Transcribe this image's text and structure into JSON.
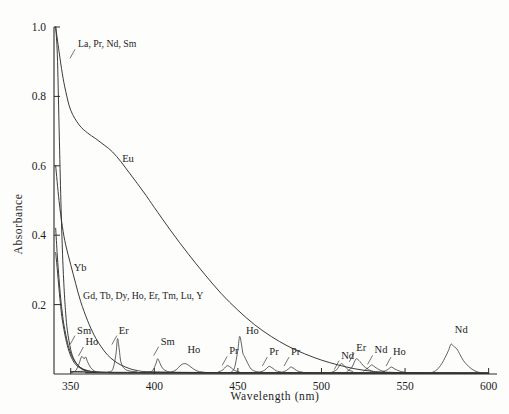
{
  "figure": {
    "title": "",
    "background_color": "#fdfdfc",
    "line_color": "#30302e"
  },
  "chart_data": {
    "type": "line",
    "title": "",
    "subtitle": "",
    "xlabel": "Wavelength  (nm)",
    "ylabel": "Absorbance",
    "xlim": [
      340,
      605
    ],
    "ylim": [
      0,
      1.0
    ],
    "grid": false,
    "legend": "inline-annotations",
    "xticks": [
      350,
      400,
      450,
      500,
      550,
      600
    ],
    "xtick_labels": [
      "350",
      "400",
      "450",
      "500",
      "550",
      "600"
    ],
    "yticks": [
      0.2,
      0.4,
      0.6,
      0.8,
      1.0
    ],
    "ytick_labels": [
      "0.2",
      "0.4",
      "0.6",
      "0.8",
      "1.0"
    ],
    "annotations": [
      {
        "text": "La, Pr, Nd, Sm",
        "x": 352,
        "y": 0.93,
        "leader": true
      },
      {
        "text": "Eu",
        "x": 379,
        "y": 0.6,
        "leader": false
      },
      {
        "text": "Yb",
        "x": 350,
        "y": 0.285,
        "leader": false
      },
      {
        "text": "Gd, Tb, Dy, Ho, Er, Tm, Lu, Y",
        "x": 355,
        "y": 0.205,
        "leader": false
      },
      {
        "text": "Sm",
        "x": 352,
        "y": 0.105,
        "leader": true
      },
      {
        "text": "Ho",
        "x": 357,
        "y": 0.072,
        "leader": true
      },
      {
        "text": "Er",
        "x": 377,
        "y": 0.105,
        "leader": true
      },
      {
        "text": "Sm",
        "x": 402,
        "y": 0.073,
        "leader": true
      },
      {
        "text": "Ho",
        "x": 418,
        "y": 0.048,
        "leader": false
      },
      {
        "text": "Pr",
        "x": 443,
        "y": 0.045,
        "leader": true
      },
      {
        "text": "Ho",
        "x": 453,
        "y": 0.105,
        "leader": false
      },
      {
        "text": "Pr",
        "x": 467,
        "y": 0.043,
        "leader": true
      },
      {
        "text": "Pr",
        "x": 480,
        "y": 0.043,
        "leader": true
      },
      {
        "text": "Nd",
        "x": 510,
        "y": 0.033,
        "leader": true
      },
      {
        "text": "Er",
        "x": 519,
        "y": 0.055,
        "leader": true
      },
      {
        "text": "Nd",
        "x": 530,
        "y": 0.048,
        "leader": true
      },
      {
        "text": "Ho",
        "x": 541,
        "y": 0.043,
        "leader": true
      },
      {
        "text": "Nd",
        "x": 578,
        "y": 0.108,
        "leader": false
      }
    ],
    "series": [
      {
        "name": "La, Pr, Nd, Sm",
        "description": "steep edge absorption rising off-scale below 343 nm",
        "points": [
          [
            341,
            1.0
          ],
          [
            342,
            0.92
          ],
          [
            343,
            0.72
          ],
          [
            344,
            0.52
          ],
          [
            345,
            0.36
          ],
          [
            346,
            0.25
          ],
          [
            347,
            0.175
          ],
          [
            348,
            0.125
          ],
          [
            350,
            0.07
          ],
          [
            352,
            0.042
          ],
          [
            355,
            0.022
          ],
          [
            360,
            0.01
          ],
          [
            370,
            0.005
          ],
          [
            400,
            0.003
          ],
          [
            600,
            0.002
          ]
        ]
      },
      {
        "name": "Eu",
        "description": "broad decaying band from 1.0 at 341 nm to baseline near 525 nm",
        "points": [
          [
            341,
            1.0
          ],
          [
            343,
            0.93
          ],
          [
            345,
            0.865
          ],
          [
            347,
            0.815
          ],
          [
            350,
            0.76
          ],
          [
            355,
            0.718
          ],
          [
            360,
            0.695
          ],
          [
            365,
            0.678
          ],
          [
            370,
            0.66
          ],
          [
            375,
            0.64
          ],
          [
            380,
            0.612
          ],
          [
            385,
            0.58
          ],
          [
            390,
            0.548
          ],
          [
            395,
            0.515
          ],
          [
            400,
            0.48
          ],
          [
            410,
            0.412
          ],
          [
            420,
            0.348
          ],
          [
            430,
            0.288
          ],
          [
            440,
            0.232
          ],
          [
            450,
            0.184
          ],
          [
            460,
            0.142
          ],
          [
            470,
            0.108
          ],
          [
            480,
            0.08
          ],
          [
            490,
            0.058
          ],
          [
            500,
            0.04
          ],
          [
            510,
            0.026
          ],
          [
            520,
            0.015
          ],
          [
            530,
            0.008
          ],
          [
            540,
            0.005
          ],
          [
            560,
            0.003
          ],
          [
            600,
            0.002
          ]
        ]
      },
      {
        "name": "Yb",
        "description": "mid steep edge decaying to baseline near 380 nm",
        "points": [
          [
            341,
            0.6
          ],
          [
            343,
            0.5
          ],
          [
            345,
            0.425
          ],
          [
            347,
            0.372
          ],
          [
            350,
            0.315
          ],
          [
            353,
            0.26
          ],
          [
            356,
            0.208
          ],
          [
            360,
            0.155
          ],
          [
            364,
            0.112
          ],
          [
            368,
            0.08
          ],
          [
            372,
            0.055
          ],
          [
            376,
            0.038
          ],
          [
            380,
            0.026
          ],
          [
            385,
            0.016
          ],
          [
            390,
            0.01
          ],
          [
            400,
            0.006
          ],
          [
            450,
            0.004
          ],
          [
            600,
            0.003
          ]
        ]
      },
      {
        "name": "Gd, Tb, Dy, Ho, Er, Tm, Lu, Y",
        "description": "sharp edge decaying to baseline near 362 nm",
        "points": [
          [
            341,
            0.42
          ],
          [
            342,
            0.34
          ],
          [
            343,
            0.275
          ],
          [
            344,
            0.218
          ],
          [
            345,
            0.175
          ],
          [
            346,
            0.14
          ],
          [
            348,
            0.092
          ],
          [
            350,
            0.06
          ],
          [
            352,
            0.04
          ],
          [
            354,
            0.027
          ],
          [
            356,
            0.018
          ],
          [
            358,
            0.012
          ],
          [
            361,
            0.008
          ],
          [
            365,
            0.005
          ],
          [
            380,
            0.003
          ],
          [
            600,
            0.002
          ]
        ]
      },
      {
        "name": "Sm",
        "description": "sharp edge near 341-352 nm plus bands at 402 nm",
        "points": [
          [
            341,
            0.35
          ],
          [
            342,
            0.3
          ],
          [
            343,
            0.245
          ],
          [
            344,
            0.195
          ],
          [
            345,
            0.155
          ],
          [
            347,
            0.102
          ],
          [
            349,
            0.065
          ],
          [
            351,
            0.042
          ],
          [
            353,
            0.027
          ],
          [
            356,
            0.016
          ],
          [
            360,
            0.009
          ],
          [
            370,
            0.005
          ],
          [
            600,
            0.003
          ]
        ]
      },
      {
        "name": "Ho band 357 nm",
        "peak_center": 357,
        "peak_height": 0.052,
        "points": [
          [
            350,
            0.004
          ],
          [
            353,
            0.01
          ],
          [
            355,
            0.03
          ],
          [
            356.5,
            0.05
          ],
          [
            358,
            0.044
          ],
          [
            359,
            0.049
          ],
          [
            360,
            0.036
          ],
          [
            362,
            0.018
          ],
          [
            365,
            0.007
          ],
          [
            370,
            0.004
          ]
        ]
      },
      {
        "name": "Er band 378 nm",
        "peak_center": 378,
        "peak_height": 0.102,
        "points": [
          [
            372,
            0.006
          ],
          [
            375,
            0.012
          ],
          [
            377,
            0.055
          ],
          [
            378,
            0.102
          ],
          [
            379,
            0.072
          ],
          [
            380,
            0.035
          ],
          [
            382,
            0.016
          ],
          [
            385,
            0.009
          ],
          [
            390,
            0.006
          ]
        ]
      },
      {
        "name": "Sm band 402 nm",
        "peak_center": 402,
        "peak_height": 0.044,
        "points": [
          [
            396,
            0.004
          ],
          [
            399,
            0.01
          ],
          [
            401,
            0.03
          ],
          [
            402,
            0.044
          ],
          [
            403.5,
            0.03
          ],
          [
            405,
            0.016
          ],
          [
            408,
            0.007
          ],
          [
            412,
            0.005
          ]
        ]
      },
      {
        "name": "Ho band 418 nm",
        "peak_center": 418,
        "peak_height": 0.03,
        "points": [
          [
            410,
            0.005
          ],
          [
            413,
            0.012
          ],
          [
            416,
            0.026
          ],
          [
            418,
            0.03
          ],
          [
            420,
            0.027
          ],
          [
            423,
            0.016
          ],
          [
            426,
            0.008
          ],
          [
            430,
            0.005
          ]
        ]
      },
      {
        "name": "Pr band 444 nm",
        "peak_center": 444,
        "peak_height": 0.024,
        "points": [
          [
            438,
            0.005
          ],
          [
            441,
            0.012
          ],
          [
            443,
            0.022
          ],
          [
            444,
            0.024
          ],
          [
            446,
            0.018
          ],
          [
            448,
            0.01
          ],
          [
            451,
            0.006
          ]
        ]
      },
      {
        "name": "Ho band 451 nm",
        "peak_center": 451,
        "peak_height": 0.108,
        "points": [
          [
            446,
            0.006
          ],
          [
            448,
            0.018
          ],
          [
            450,
            0.07
          ],
          [
            451,
            0.108
          ],
          [
            452,
            0.09
          ],
          [
            453,
            0.06
          ],
          [
            454,
            0.05
          ],
          [
            456,
            0.03
          ],
          [
            458,
            0.014
          ],
          [
            461,
            0.007
          ],
          [
            465,
            0.005
          ]
        ]
      },
      {
        "name": "Pr band 469 nm",
        "peak_center": 469,
        "peak_height": 0.022,
        "points": [
          [
            463,
            0.005
          ],
          [
            466,
            0.011
          ],
          [
            468,
            0.02
          ],
          [
            469,
            0.022
          ],
          [
            471,
            0.016
          ],
          [
            473,
            0.009
          ],
          [
            476,
            0.006
          ]
        ]
      },
      {
        "name": "Pr band 482 nm",
        "peak_center": 482,
        "peak_height": 0.02,
        "points": [
          [
            476,
            0.005
          ],
          [
            479,
            0.01
          ],
          [
            481,
            0.018
          ],
          [
            482,
            0.02
          ],
          [
            484,
            0.014
          ],
          [
            486,
            0.008
          ],
          [
            489,
            0.005
          ]
        ]
      },
      {
        "name": "Nd band 512 nm",
        "peak_center": 512,
        "peak_height": 0.03,
        "points": [
          [
            506,
            0.005
          ],
          [
            509,
            0.012
          ],
          [
            511,
            0.026
          ],
          [
            512,
            0.03
          ],
          [
            514,
            0.022
          ],
          [
            516,
            0.012
          ],
          [
            519,
            0.007
          ]
        ]
      },
      {
        "name": "Er band 521 nm",
        "peak_center": 521,
        "peak_height": 0.044,
        "points": [
          [
            515,
            0.006
          ],
          [
            518,
            0.018
          ],
          [
            520,
            0.038
          ],
          [
            521,
            0.044
          ],
          [
            523,
            0.036
          ],
          [
            525,
            0.024
          ],
          [
            528,
            0.013
          ],
          [
            531,
            0.007
          ]
        ]
      },
      {
        "name": "Nd band 530 nm",
        "peak_center": 530,
        "peak_height": 0.026,
        "points": [
          [
            525,
            0.008
          ],
          [
            528,
            0.018
          ],
          [
            530,
            0.026
          ],
          [
            532,
            0.02
          ],
          [
            535,
            0.011
          ],
          [
            538,
            0.007
          ]
        ]
      },
      {
        "name": "Ho band 542 nm",
        "peak_center": 542,
        "peak_height": 0.02,
        "points": [
          [
            536,
            0.005
          ],
          [
            539,
            0.011
          ],
          [
            541,
            0.018
          ],
          [
            542,
            0.02
          ],
          [
            544,
            0.014
          ],
          [
            547,
            0.008
          ],
          [
            550,
            0.005
          ]
        ]
      },
      {
        "name": "Nd band 578 nm",
        "peak_center": 578,
        "peak_height": 0.086,
        "points": [
          [
            566,
            0.004
          ],
          [
            569,
            0.012
          ],
          [
            572,
            0.03
          ],
          [
            574,
            0.048
          ],
          [
            576,
            0.068
          ],
          [
            577.5,
            0.086
          ],
          [
            579,
            0.08
          ],
          [
            581,
            0.072
          ],
          [
            583,
            0.055
          ],
          [
            585,
            0.038
          ],
          [
            588,
            0.022
          ],
          [
            591,
            0.011
          ],
          [
            594,
            0.005
          ],
          [
            598,
            0.003
          ]
        ]
      }
    ]
  }
}
